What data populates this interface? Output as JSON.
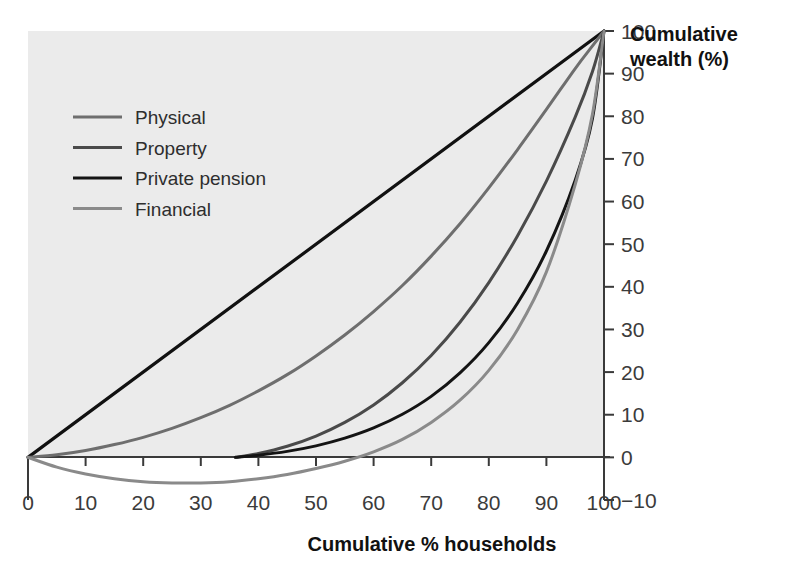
{
  "chart_data": {
    "type": "line",
    "title": "",
    "xlabel": "Cumulative % households",
    "ylabel": "Cumulative wealth (%)",
    "xlim": [
      0,
      100
    ],
    "ylim": [
      -10,
      100
    ],
    "xticks": [
      0,
      10,
      20,
      30,
      40,
      50,
      60,
      70,
      80,
      90,
      100
    ],
    "xtick_labels": [
      "0",
      "10",
      "20",
      "30",
      "40",
      "50",
      "60",
      "70",
      "80",
      "90",
      "100"
    ],
    "yticks": [
      -10,
      0,
      10,
      20,
      30,
      40,
      50,
      60,
      70,
      80,
      90,
      100
    ],
    "ytick_labels": [
      "−10",
      "0",
      "10",
      "20",
      "30",
      "40",
      "50",
      "60",
      "70",
      "80",
      "90",
      "100"
    ],
    "y_axis_position": "right",
    "grid": false,
    "legend_position": "upper-left",
    "plot_background": "#ebebeb",
    "equality_line": {
      "name": "Line of equality",
      "color": "#111111",
      "width": 3.2,
      "x": [
        0,
        100
      ],
      "y": [
        0,
        100
      ],
      "in_legend": false
    },
    "series": [
      {
        "name": "Physical",
        "color": "#6e6e6e",
        "width": 3.0,
        "x": [
          0,
          5,
          10,
          15,
          20,
          25,
          30,
          35,
          40,
          45,
          50,
          55,
          60,
          65,
          70,
          75,
          80,
          85,
          90,
          95,
          98,
          100
        ],
        "y": [
          0,
          0.6,
          1.6,
          3.0,
          4.7,
          6.8,
          9.3,
          12.2,
          15.6,
          19.4,
          23.8,
          28.7,
          34.2,
          40.3,
          47.2,
          54.8,
          63.2,
          72.2,
          81.6,
          91.2,
          96.5,
          100
        ]
      },
      {
        "name": "Property",
        "color": "#4a4a4a",
        "width": 3.0,
        "x": [
          36,
          40,
          45,
          50,
          55,
          60,
          65,
          70,
          75,
          80,
          85,
          90,
          95,
          98,
          100
        ],
        "y": [
          0,
          0.9,
          2.6,
          5.0,
          8.2,
          12.3,
          17.5,
          23.9,
          31.7,
          41.0,
          52.0,
          64.8,
          79.8,
          90.5,
          100
        ]
      },
      {
        "name": "Private pension",
        "color": "#141414",
        "width": 3.0,
        "x": [
          36,
          40,
          45,
          50,
          55,
          60,
          65,
          70,
          75,
          80,
          85,
          90,
          95,
          98,
          100
        ],
        "y": [
          0,
          0.5,
          1.4,
          2.7,
          4.5,
          6.9,
          10.1,
          14.3,
          19.8,
          26.9,
          36.2,
          48.4,
          65.0,
          79.5,
          100
        ]
      },
      {
        "name": "Financial",
        "color": "#8a8a8a",
        "width": 3.0,
        "x": [
          0,
          5,
          10,
          15,
          20,
          25,
          30,
          35,
          40,
          45,
          50,
          55,
          60,
          65,
          70,
          75,
          80,
          85,
          90,
          95,
          98,
          100
        ],
        "y": [
          0,
          -2.3,
          -3.9,
          -5.0,
          -5.7,
          -6.0,
          -6.0,
          -5.7,
          -5.0,
          -4.0,
          -2.6,
          -0.9,
          1.3,
          4.2,
          8.2,
          13.4,
          20.4,
          30.0,
          43.5,
          64.0,
          80.5,
          100
        ]
      }
    ],
    "legend": [
      {
        "label": "Physical",
        "color": "#6e6e6e"
      },
      {
        "label": "Property",
        "color": "#4a4a4a"
      },
      {
        "label": "Private pension",
        "color": "#141414"
      },
      {
        "label": "Financial",
        "color": "#8a8a8a"
      }
    ]
  }
}
